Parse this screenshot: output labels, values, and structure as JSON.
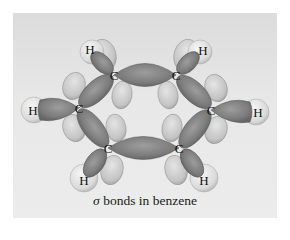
{
  "figure": {
    "caption": {
      "symbol": "σ",
      "text": " bonds in benzene"
    },
    "atoms": {
      "c_top_left": "C",
      "c_top_right": "C",
      "c_left": "C",
      "c_right": "C",
      "c_bottom_left": "C",
      "c_bottom_right": "C",
      "h_top_left": "H",
      "h_top_right": "H",
      "h_left": "H",
      "h_right": "H",
      "h_bottom_left": "H",
      "h_bottom_right": "H"
    },
    "colors": {
      "background": "#e6e6e6",
      "sigma_lobe": "#8a8a8a",
      "p_lobe": "#c9c9c9",
      "h_sphere": "#e2e2e2"
    }
  }
}
